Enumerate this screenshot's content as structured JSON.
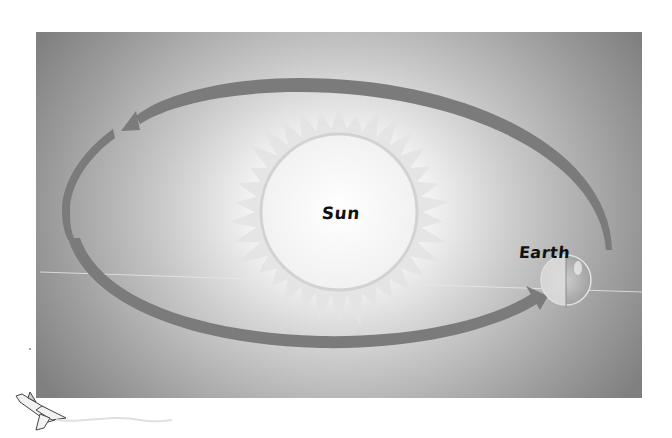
{
  "diagram": {
    "type": "orbit",
    "labels": {
      "sun": "Sun",
      "earth": "Earth"
    },
    "orbit_direction": "counterclockwise",
    "elements": [
      "panel-background",
      "sun",
      "sun-rays",
      "orbit-arrow-top",
      "orbit-arrow-bottom",
      "earth",
      "space-shuttle"
    ]
  },
  "colors": {
    "panel_edge": "#8a8a8a",
    "panel_center": "#ffffff",
    "orbit_arrow": "#7a7a7a",
    "sun_disc": "#f6f6f6",
    "sun_ring": "#d4d4d4",
    "sun_rays": "#e6e6e6",
    "label_text": "#111111"
  }
}
